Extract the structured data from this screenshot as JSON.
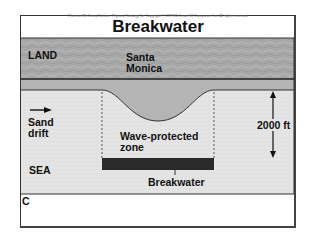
{
  "header": {
    "copyright": "Plummer/McGeary/Carlson, Physical Geology 8e. Copyright © 1999 McGraw-Hill Companies Inc. All rights reserved.",
    "title": "Breakwater"
  },
  "labels": {
    "land": "LAND",
    "city_line1": "Santa",
    "city_line2": "Monica",
    "sand_line1": "Sand",
    "sand_line2": "drift",
    "zone_line1": "Wave-protected",
    "zone_line2": "zone",
    "distance": "2000 ft",
    "sea": "SEA",
    "breakwater": "Breakwater",
    "panel": "C"
  },
  "colors": {
    "land": "#a6a6a6",
    "beach": "#b8b8b8",
    "sea": "#e6e6e6",
    "breakwater": "#2a2a2a",
    "line": "#222222"
  }
}
